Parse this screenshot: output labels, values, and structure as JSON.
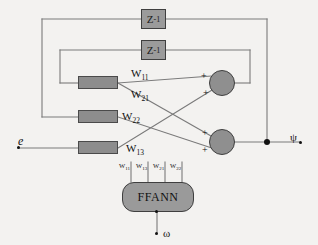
{
  "diagram": {
    "background_color": "#f3f2f0",
    "wire_color": "#7a7a7a",
    "block_fill": "#8d8d8d",
    "block_stroke": "#4a4a4a"
  },
  "delays": [
    {
      "name": "delay-top",
      "label": "Z",
      "exponent": "-1"
    },
    {
      "name": "delay-inner",
      "label": "Z",
      "exponent": "-1"
    }
  ],
  "weight_blocks": [
    {
      "name": "weight-block-1"
    },
    {
      "name": "weight-block-2"
    },
    {
      "name": "weight-block-3"
    }
  ],
  "weight_labels": [
    {
      "base": "W",
      "sub": "11"
    },
    {
      "base": "W",
      "sub": "21"
    },
    {
      "base": "W",
      "sub": "22"
    },
    {
      "base": "W",
      "sub": "13"
    }
  ],
  "ffann": {
    "label": "FFANN",
    "inputs": [
      {
        "base": "W",
        "sub": "11"
      },
      {
        "base": "W",
        "sub": "13"
      },
      {
        "base": "W",
        "sub": "21"
      },
      {
        "base": "W",
        "sub": "22"
      }
    ],
    "control_input": "ω"
  },
  "summing_junctions": [
    {
      "name": "sum-junction-top",
      "signs": [
        "+",
        "+"
      ]
    },
    {
      "name": "sum-junction-bottom",
      "signs": [
        "+",
        "+"
      ]
    }
  ],
  "signals": {
    "input": "e",
    "output": "ψ"
  }
}
